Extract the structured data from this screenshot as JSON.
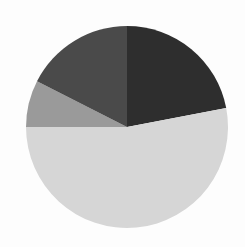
{
  "chart_data": {
    "type": "pie",
    "title": "",
    "legend": null,
    "start_angle_deg": 0,
    "direction": "clockwise",
    "center": [
      127,
      127
    ],
    "radius": 101,
    "slices": [
      {
        "label": "",
        "value": 22.0,
        "color": "#2e2e2e"
      },
      {
        "label": "",
        "value": 53.0,
        "color": "#d6d6d6"
      },
      {
        "label": "",
        "value": 7.5,
        "color": "#9a9a9a"
      },
      {
        "label": "",
        "value": 17.5,
        "color": "#4a4a4a"
      }
    ],
    "values": [
      22.0,
      53.0,
      7.5,
      17.5
    ],
    "categories": [
      "",
      "",
      "",
      ""
    ]
  }
}
